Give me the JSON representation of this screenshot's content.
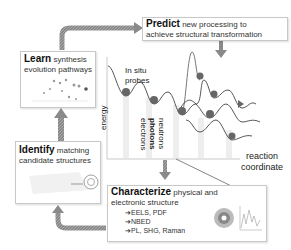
{
  "predict": {
    "keyword": "Predict",
    "rest1": "new processing to",
    "line2": "achieve structural transformation"
  },
  "learn": {
    "keyword": "Learn",
    "rest1": "synthesis",
    "line2": "evolution pathways"
  },
  "identify": {
    "keyword": "Identify",
    "rest1": "matching",
    "line2": "candidate structures"
  },
  "characterize": {
    "keyword": "Characterize",
    "rest1": "physical and",
    "line2": "electronic structure",
    "items": [
      "➔EELS, PDF",
      "➔NBED",
      "➔PL, SHG, Raman"
    ]
  },
  "chart": {
    "probes_label_1": "In situ",
    "probes_label_2": "probes",
    "y_axis": "energy",
    "x_axis_1": "reaction",
    "x_axis_2": "coordinate",
    "probe_types": [
      "electrons",
      "photons",
      "neutrons"
    ]
  },
  "colors": {
    "arrow": "#8a8a8a",
    "border": "#c8c8c8",
    "curve": "#444444"
  }
}
